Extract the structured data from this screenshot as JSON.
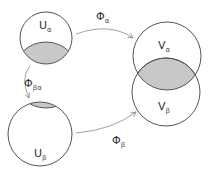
{
  "diagram": {
    "title": "",
    "nodes": [
      {
        "id": "U_alpha",
        "label": "U",
        "subscript": "α"
      },
      {
        "id": "U_beta",
        "label": "U",
        "subscript": "β"
      },
      {
        "id": "V_alpha",
        "label": "V",
        "subscript": "α"
      },
      {
        "id": "V_beta",
        "label": "V",
        "subscript": "β"
      }
    ],
    "edges": [
      {
        "from": "U_alpha",
        "to": "V_alpha",
        "label": "Φ",
        "subscript": "α"
      },
      {
        "from": "U_alpha",
        "to": "U_beta",
        "label": "Φ",
        "subscript": "βα"
      },
      {
        "from": "U_beta",
        "to": "V_beta",
        "label": "Φ",
        "subscript": "β"
      }
    ],
    "colors": {
      "stroke": "#555555",
      "overlap_fill": "#c8c8c8",
      "arrow": "#8a8a8a"
    }
  }
}
